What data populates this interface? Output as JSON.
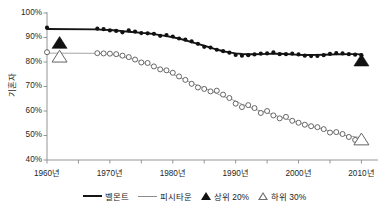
{
  "chart_data": {
    "type": "line",
    "title": "",
    "xlabel": "",
    "ylabel": "기혼자",
    "xlim": [
      1960,
      2012
    ],
    "ylim": [
      40,
      100
    ],
    "grid": false,
    "legend_position": "bottom",
    "y_tick_labels": [
      "100%",
      "90%",
      "80%",
      "70%",
      "60%",
      "50%",
      "40%"
    ],
    "y_tick_values": [
      100,
      90,
      80,
      70,
      60,
      50,
      40
    ],
    "x_tick_labels": [
      "1960년",
      "1970년",
      "1980년",
      "1990년",
      "2000년",
      "2010년"
    ],
    "x_tick_values": [
      1960,
      1970,
      1980,
      1990,
      2000,
      2010
    ],
    "x_minor_tick_values": [
      1965,
      1975,
      1985,
      1995,
      2005
    ],
    "series": [
      {
        "name": "벨몬트",
        "style": "line-with-filled-circle-markers",
        "color": "#151515",
        "x": [
          1960,
          1968,
          1969,
          1970,
          1971,
          1972,
          1973,
          1974,
          1975,
          1976,
          1977,
          1978,
          1979,
          1980,
          1981,
          1982,
          1983,
          1984,
          1985,
          1986,
          1987,
          1988,
          1989,
          1990,
          1991,
          1992,
          1993,
          1994,
          1995,
          1996,
          1997,
          1998,
          1999,
          2000,
          2001,
          2002,
          2003,
          2004,
          2005,
          2006,
          2007,
          2008,
          2009,
          2010
        ],
        "values": [
          94.0,
          93.6,
          93.4,
          92.9,
          92.7,
          92.1,
          92.9,
          92.4,
          91.8,
          91.7,
          91.5,
          90.7,
          91.0,
          90.4,
          89.6,
          89.1,
          88.4,
          87.4,
          86.2,
          85.9,
          85.0,
          84.4,
          83.8,
          82.9,
          82.6,
          82.8,
          83.1,
          83.4,
          83.5,
          83.9,
          83.2,
          83.2,
          83.4,
          83.1,
          82.6,
          82.4,
          82.5,
          82.8,
          83.3,
          83.6,
          83.5,
          83.2,
          83.0,
          82.8
        ]
      },
      {
        "name": "피시타운",
        "style": "line-with-open-circle-markers",
        "color": "#8d8d8d",
        "x": [
          1960,
          1968,
          1969,
          1970,
          1971,
          1972,
          1973,
          1974,
          1975,
          1976,
          1977,
          1978,
          1979,
          1980,
          1981,
          1982,
          1983,
          1984,
          1985,
          1986,
          1987,
          1988,
          1989,
          1990,
          1991,
          1992,
          1993,
          1994,
          1995,
          1996,
          1997,
          1998,
          1999,
          2000,
          2001,
          2002,
          2003,
          2004,
          2005,
          2006,
          2007,
          2008,
          2009,
          2010
        ],
        "values": [
          84.0,
          83.6,
          83.5,
          83.4,
          83.2,
          82.6,
          82.0,
          81.0,
          79.8,
          79.6,
          78.2,
          77.0,
          76.6,
          75.6,
          74.1,
          72.7,
          71.1,
          69.6,
          69.0,
          68.0,
          68.3,
          66.7,
          65.3,
          63.0,
          61.6,
          62.4,
          61.2,
          59.2,
          60.0,
          58.2,
          57.0,
          57.6,
          56.0,
          55.2,
          54.4,
          53.8,
          53.4,
          52.6,
          51.2,
          51.4,
          50.6,
          49.4,
          48.2,
          48.0
        ]
      }
    ],
    "point_markers": [
      {
        "name": "상위 20%",
        "style": "filled-triangle",
        "color": "#111111",
        "x": 1962,
        "y": 87.6
      },
      {
        "name": "하위 30%",
        "style": "open-triangle",
        "color": "#6e6e6e",
        "x": 1962,
        "y": 82.0
      },
      {
        "name": "상위 20%",
        "style": "filled-triangle",
        "color": "#111111",
        "x": 2010,
        "y": 80.4
      },
      {
        "name": "하위 30%",
        "style": "open-triangle",
        "color": "#6e6e6e",
        "x": 2010,
        "y": 48.2
      }
    ],
    "legend": [
      {
        "label": "벨몬트",
        "marker": "thick-line",
        "color": "#151515"
      },
      {
        "label": "피시타운",
        "marker": "thin-line",
        "color": "#8d8d8d"
      },
      {
        "label": "상위 20%",
        "marker": "filled-triangle",
        "color": "#111111"
      },
      {
        "label": "하위 30%",
        "marker": "open-triangle",
        "color": "#6e6e6e"
      }
    ]
  }
}
